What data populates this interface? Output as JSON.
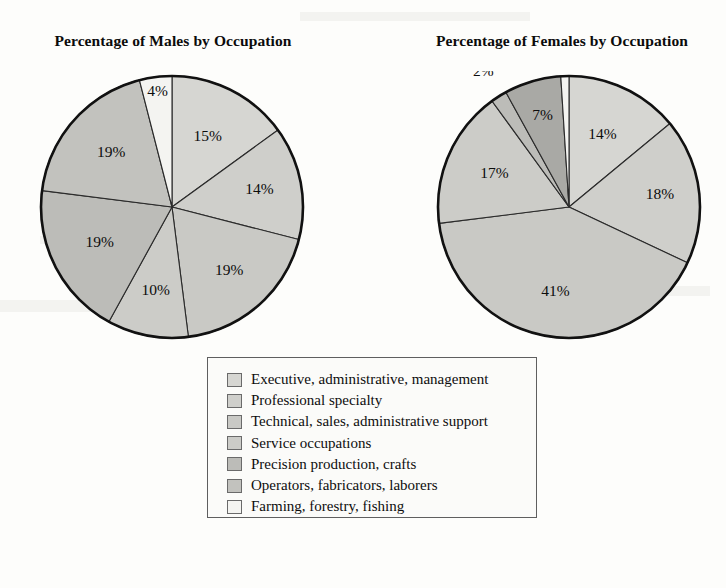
{
  "chart_data": [
    {
      "type": "pie",
      "title": "Percentage of Males by Occupation",
      "unit": "%",
      "categories": [
        "Executive, administrative, management",
        "Professional specialty",
        "Technical, sales, administrative support",
        "Service occupations",
        "Precision production, crafts",
        "Operators, fabricators, laborers",
        "Farming, forestry, fishing"
      ],
      "values": [
        15,
        14,
        19,
        10,
        19,
        19,
        4
      ],
      "labels": [
        "15%",
        "14%",
        "19%",
        "10%",
        "19%",
        "19%",
        "4%"
      ],
      "start_angle_deg": 0,
      "direction": "clockwise",
      "legend_position": "bottom-center"
    },
    {
      "type": "pie",
      "title": "Percentage of Females by Occupation",
      "unit": "%",
      "categories": [
        "Executive, administrative, management",
        "Professional specialty",
        "Technical, sales, administrative support",
        "Service occupations",
        "Precision production, crafts",
        "Operators, fabricators, laborers",
        "Farming, forestry, fishing"
      ],
      "values": [
        14,
        18,
        41,
        17,
        2,
        7,
        1
      ],
      "labels": [
        "14%",
        "18%",
        "41%",
        "17%",
        "2%",
        "7%",
        "1%"
      ],
      "start_angle_deg": 0,
      "direction": "clockwise",
      "legend_position": "bottom-center"
    }
  ],
  "titles": {
    "male": "Percentage of Males by Occupation",
    "female": "Percentage of Females by Occupation"
  },
  "legend": {
    "items": [
      {
        "label": "Executive, administrative, management",
        "color": "#d6d6d2"
      },
      {
        "label": "Professional specialty",
        "color": "#cfcfcb"
      },
      {
        "label": "Technical, sales, administrative support",
        "color": "#c9c9c5"
      },
      {
        "label": "Service occupations",
        "color": "#ccccc8"
      },
      {
        "label": "Precision production, crafts",
        "color": "#bcbcb8"
      },
      {
        "label": "Operators, fabricators, laborers",
        "color": "#c2c2be"
      },
      {
        "label": "Farming, forestry, fishing",
        "color": "#f4f4f1"
      }
    ]
  },
  "male_pie": {
    "slices": [
      {
        "name": "Executive, administrative, management",
        "value": 15,
        "label": "15%",
        "color": "#d6d6d2"
      },
      {
        "name": "Professional specialty",
        "value": 14,
        "label": "14%",
        "color": "#cfcfcb"
      },
      {
        "name": "Technical, sales, administrative support",
        "value": 19,
        "label": "19%",
        "color": "#c9c9c5"
      },
      {
        "name": "Service occupations",
        "value": 10,
        "label": "10%",
        "color": "#ccccc8"
      },
      {
        "name": "Precision production, crafts",
        "value": 19,
        "label": "19%",
        "color": "#bcbcb8"
      },
      {
        "name": "Operators, fabricators, laborers",
        "value": 19,
        "label": "19%",
        "color": "#c2c2be"
      },
      {
        "name": "Farming, forestry, fishing",
        "value": 4,
        "label": "4%",
        "color": "#f4f4f1"
      }
    ]
  },
  "female_pie": {
    "slices": [
      {
        "name": "Executive, administrative, management",
        "value": 14,
        "label": "14%",
        "color": "#d6d6d2"
      },
      {
        "name": "Professional specialty",
        "value": 18,
        "label": "18%",
        "color": "#cfcfcb"
      },
      {
        "name": "Technical, sales, administrative support",
        "value": 41,
        "label": "41%",
        "color": "#c9c9c5"
      },
      {
        "name": "Service occupations",
        "value": 17,
        "label": "17%",
        "color": "#ccccc8"
      },
      {
        "name": "Precision production, crafts",
        "value": 2,
        "label": "2%",
        "color": "#bcbcb8"
      },
      {
        "name": "Operators, fabricators, laborers",
        "value": 7,
        "label": "7%",
        "color": "#a9a9a5"
      },
      {
        "name": "Farming, forestry, fishing",
        "value": 1,
        "label": "1%",
        "color": "#f4f4f1"
      }
    ]
  },
  "style": {
    "outline_color": "#111111",
    "divider_color": "#2a2a2a",
    "page_background": "#fdfdfb"
  }
}
